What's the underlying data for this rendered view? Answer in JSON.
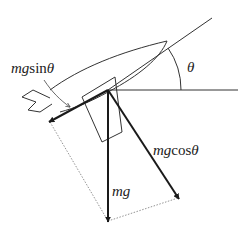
{
  "diagram": {
    "type": "force-decomposition",
    "colors": {
      "line": "#333333",
      "arrow": "#1a1a1a",
      "dotted": "#777777",
      "background": "#ffffff"
    },
    "labels": {
      "angle": "θ",
      "weight": "mg",
      "along_path": {
        "prefix": "mg",
        "func": "sin",
        "var": "θ"
      },
      "perpendicular": {
        "prefix": "mg",
        "func": "cos",
        "var": "θ"
      }
    },
    "forces": [
      {
        "name": "mg",
        "direction": "vertical-down"
      },
      {
        "name": "mgsinθ",
        "direction": "along-path-backward"
      },
      {
        "name": "mgcosθ",
        "direction": "perpendicular-to-path"
      }
    ]
  }
}
